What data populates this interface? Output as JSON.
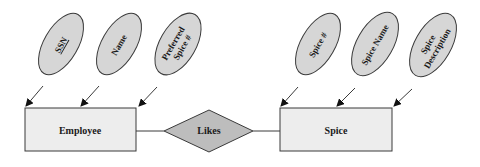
{
  "diagram": {
    "type": "er-diagram",
    "colors": {
      "attribute_fill": "#d6d6d6",
      "entity_fill": "#ededed",
      "relationship_fill": "#bdbdbd",
      "stroke": "#3a3a3a",
      "text": "#1a1a1a"
    },
    "entities": [
      {
        "id": "employee",
        "label": "Employee",
        "attributes": [
          {
            "id": "ssn",
            "lines": [
              "SSN"
            ],
            "key": true
          },
          {
            "id": "name",
            "lines": [
              "Name"
            ],
            "key": false
          },
          {
            "id": "preferred-spice",
            "lines": [
              "Preferred",
              "Spice #"
            ],
            "key": false
          }
        ]
      },
      {
        "id": "spice",
        "label": "Spice",
        "attributes": [
          {
            "id": "spice-num",
            "lines": [
              "Spice #"
            ],
            "key": false
          },
          {
            "id": "spice-name",
            "lines": [
              "Spice Name"
            ],
            "key": false
          },
          {
            "id": "spice-description",
            "lines": [
              "Spice",
              "Description"
            ],
            "key": false
          }
        ]
      }
    ],
    "relationships": [
      {
        "id": "likes",
        "label": "Likes",
        "from": "employee",
        "to": "spice"
      }
    ]
  }
}
